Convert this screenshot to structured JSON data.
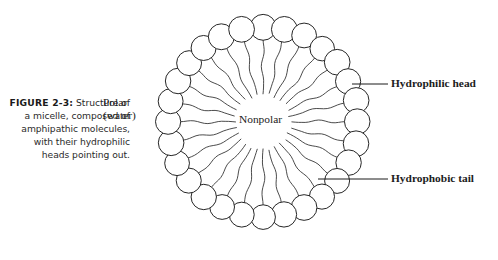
{
  "figure": {
    "id_label": "FIGURE 2-3:",
    "caption": "Structure of a micelle, composed of amphipathic molecules, with their hydrophilic heads pointing out.",
    "background_color": "#ffffff",
    "ink_color": "#1a1a1a"
  },
  "diagram": {
    "type": "micelle-cross-section",
    "center_label": "Nonpolar",
    "exterior_label_line1": "Polar",
    "exterior_label_line2": "(water)",
    "callouts": [
      {
        "name": "hydrophilic-head",
        "label": "Hydrophilic head",
        "target": "outer-circle"
      },
      {
        "name": "hydrophobic-tail",
        "label": "Hydrophobic tail",
        "target": "inner-tail"
      }
    ],
    "geometry": {
      "center_x": 263,
      "center_y": 122,
      "head_count": 28,
      "head_radius": 12.6,
      "head_ring_radius": 95,
      "tail_inner_radius": 28,
      "tail_wave_amplitude": 1.8
    },
    "colors": {
      "head_fill": "#ffffff",
      "head_stroke": "#1a1a1a",
      "tail_stroke": "#2a2a2a",
      "leader_stroke": "#1a1a1a"
    }
  }
}
